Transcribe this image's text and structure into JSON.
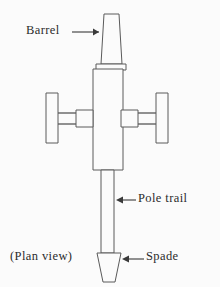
{
  "figure": {
    "caption": "(Plan view)",
    "background_color": "#fbfbfb",
    "line_color": "#5a5a5a",
    "text_color": "#2b2b2b",
    "view_box": "0 0 220 287"
  },
  "labels": {
    "barrel": "Barrel",
    "pole_trail": "Pole trail",
    "spade": "Spade",
    "plan_view": "(Plan view)"
  },
  "parts": {
    "barrel": {
      "name": "Barrel",
      "shape": "tapered-trapezoid",
      "points": "104,14 119,14 122,64 101,64"
    },
    "breech_collar": {
      "name": "Breech collar",
      "shape": "rectangle",
      "points": "96,64 126,64 126,70 96,70"
    },
    "carriage_body": {
      "name": "Carriage body",
      "shape": "rectangle",
      "points": "93,69 123,69 123,170 93,170"
    },
    "left_wheel": {
      "name": "Left wheel",
      "shape": "rectangle",
      "points": "46,93 58,93 58,143 46,143"
    },
    "right_wheel": {
      "name": "Right wheel",
      "shape": "rectangle",
      "points": "156,93 168,93 168,143 156,143"
    },
    "left_hub": {
      "name": "Left hub",
      "shape": "rectangle",
      "points": "76,110 93,110 93,127 76,127"
    },
    "right_hub": {
      "name": "Right hub",
      "shape": "rectangle",
      "points": "121,110 138,110 138,127 121,127"
    },
    "left_axle_upper": {
      "name": "Left upper axle arm",
      "points": "58,113 76,113"
    },
    "left_axle_lower": {
      "name": "Left lower axle arm",
      "points": "58,124 76,124"
    },
    "right_axle_upper": {
      "name": "Right upper axle arm",
      "points": "138,113 156,113"
    },
    "right_axle_lower": {
      "name": "Right lower axle arm",
      "points": "138,124 156,124"
    },
    "pole_trail": {
      "name": "Pole trail",
      "shape": "rectangle",
      "points": "101,170 114,170 114,253 101,253"
    },
    "spade": {
      "name": "Spade",
      "shape": "inverted-trapezoid",
      "points": "97,253 121,253 115,282 103,282"
    }
  },
  "leaders": {
    "barrel": {
      "name": "Barrel leader line",
      "line": "72,32 99,32",
      "arrow": "99,32 93,28.5 93,35.5",
      "direction": "right"
    },
    "pole_trail": {
      "name": "Pole trail leader line",
      "line": "118,200 136,200",
      "arrow": "116,200 123,196.5 123,203.5",
      "direction": "left"
    },
    "spade": {
      "name": "Spade leader line",
      "line": "124,259 144,259",
      "arrow": "122,259 129,255.5 129,262.5",
      "direction": "left"
    }
  }
}
